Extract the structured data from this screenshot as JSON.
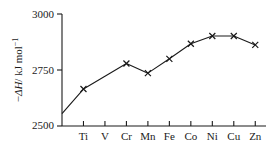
{
  "chart_data": {
    "type": "line",
    "title": "",
    "subtitle": "",
    "xlabel": "",
    "ylabel": "−ΔH/ kJ mol⁻¹",
    "ylabel_parts": {
      "minus": "−",
      "delta": "Δ",
      "h_italic": "H",
      "slash_units": "/ kJ mol",
      "exponent": "−1"
    },
    "categories": [
      "Ti",
      "V",
      "Cr",
      "Mn",
      "Fe",
      "Co",
      "Ni",
      "Cu",
      "Zn"
    ],
    "values": [
      2665,
      2722,
      2779,
      2736,
      2800,
      2867,
      2902,
      2902,
      2862
    ],
    "markers": [
      true,
      false,
      true,
      true,
      true,
      true,
      true,
      true,
      true
    ],
    "origin_point": {
      "label": "",
      "value": 2555
    },
    "yticks": [
      2500,
      2750,
      3000
    ],
    "ytick_labels": [
      "2500",
      "2750",
      "3000"
    ],
    "ylim": [
      2500,
      3000
    ],
    "grid": false,
    "legend": null,
    "marker_symbol": "x",
    "line_color": "#1a1a1a",
    "marker_color": "#1a1a1a",
    "axis_color": "#1a1a1a",
    "background": "#ffffff"
  }
}
